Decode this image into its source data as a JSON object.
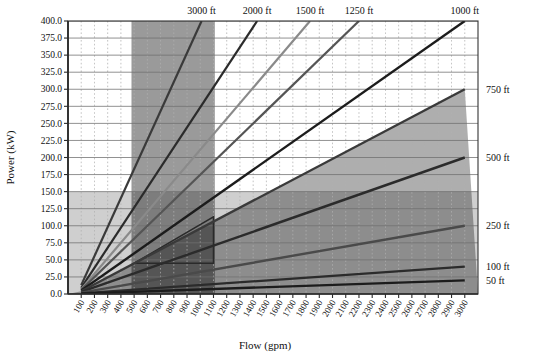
{
  "chart_data": {
    "type": "line",
    "title": "",
    "xlabel": "Flow (gpm)",
    "ylabel": "Power (kW)",
    "xlim": [
      0,
      3100
    ],
    "ylim": [
      0,
      400
    ],
    "grid": true,
    "legend_position": "inline-end-labels",
    "x_ticks": [
      100,
      200,
      300,
      400,
      500,
      600,
      700,
      800,
      900,
      1000,
      1100,
      1200,
      1300,
      1400,
      1500,
      1600,
      1700,
      1800,
      1900,
      2000,
      2100,
      2200,
      2300,
      2400,
      2500,
      2600,
      2700,
      2800,
      2900,
      3000
    ],
    "x_tick_labels": [
      "100",
      "200",
      "300",
      "400",
      "500",
      "600",
      "700",
      "800",
      "900",
      "1000",
      "1100",
      "1200",
      "1300",
      "1400",
      "1500",
      "1600",
      "1700",
      "1800",
      "1900",
      "2000",
      "2100",
      "2200",
      "2300",
      "2400",
      "2500",
      "2600",
      "2700",
      "2800",
      "2900",
      "3000"
    ],
    "y_ticks": [
      0,
      25,
      50,
      75,
      100,
      125,
      150,
      175,
      200,
      225,
      250,
      275,
      300,
      325,
      350,
      375,
      400
    ],
    "y_tick_labels": [
      "0.0",
      "25.0",
      "50.0",
      "75.0",
      "100.0",
      "125.0",
      "150.0",
      "175.0",
      "200.0",
      "225.0",
      "250.0",
      "275.0",
      "300.0",
      "325.0",
      "350.0",
      "375.0",
      "400.0"
    ],
    "series": [
      {
        "name": "3000 ft",
        "label": "3000 ft",
        "label_side": "top",
        "color": "#3a3a3a",
        "width": 2.2,
        "points": [
          [
            100,
            13
          ],
          [
            1010,
            400
          ]
        ]
      },
      {
        "name": "2000 ft",
        "label": "2000 ft",
        "label_side": "top",
        "color": "#2b2b2b",
        "width": 2.2,
        "points": [
          [
            100,
            9
          ],
          [
            1430,
            400
          ]
        ]
      },
      {
        "name": "1500 ft",
        "label": "1500 ft",
        "label_side": "top",
        "color": "#8a8a8a",
        "width": 2.2,
        "points": [
          [
            100,
            7
          ],
          [
            1830,
            400
          ]
        ]
      },
      {
        "name": "1250 ft",
        "label": "1250 ft",
        "label_side": "top",
        "color": "#555555",
        "width": 2.2,
        "points": [
          [
            100,
            6
          ],
          [
            2200,
            400
          ]
        ]
      },
      {
        "name": "1000 ft",
        "label": "1000 ft",
        "label_side": "top",
        "color": "#1c1c1c",
        "width": 2.4,
        "points": [
          [
            100,
            5
          ],
          [
            3000,
            400
          ]
        ]
      },
      {
        "name": "750 ft",
        "label": "750 ft",
        "label_side": "right",
        "color": "#3a3a3a",
        "width": 2.4,
        "points": [
          [
            100,
            4
          ],
          [
            3000,
            300
          ]
        ]
      },
      {
        "name": "500 ft",
        "label": "500 ft",
        "label_side": "right",
        "color": "#2b2b2b",
        "width": 2.4,
        "points": [
          [
            100,
            3
          ],
          [
            3000,
            200
          ]
        ]
      },
      {
        "name": "250 ft",
        "label": "250 ft",
        "label_side": "right",
        "color": "#4a4a4a",
        "width": 2.4,
        "points": [
          [
            100,
            2
          ],
          [
            3000,
            100
          ]
        ]
      },
      {
        "name": "100 ft",
        "label": "100 ft",
        "label_side": "right",
        "color": "#2b2b2b",
        "width": 2.2,
        "points": [
          [
            100,
            1
          ],
          [
            3000,
            40
          ]
        ]
      },
      {
        "name": "50 ft",
        "label": "50 ft",
        "label_side": "right",
        "color": "#1c1c1c",
        "width": 2.4,
        "points": [
          [
            100,
            0.6
          ],
          [
            3000,
            20
          ]
        ]
      }
    ],
    "shaded_regions": [
      {
        "name": "flow-band-500-1100",
        "kind": "vertical-band",
        "x0": 480,
        "x1": 1110,
        "color": "#9a9a9a",
        "opacity": 1
      },
      {
        "name": "power-band-below-150",
        "kind": "horizontal-band",
        "y0": 0,
        "y1": 150,
        "color": "#bdbdbd",
        "opacity": 1
      },
      {
        "name": "diagonal-operating-envelope",
        "kind": "below-line",
        "line": [
          [
            100,
            4
          ],
          [
            3000,
            300
          ]
        ],
        "color": "#9a9a9a",
        "opacity": 1
      },
      {
        "name": "core-operating-box",
        "kind": "outline-polygon",
        "points": [
          [
            500,
            45
          ],
          [
            1100,
            45
          ],
          [
            1100,
            113
          ],
          [
            500,
            45
          ]
        ],
        "stroke": "#2a2a2a"
      }
    ],
    "annotations": [
      {
        "text": "3000 ft",
        "x": 1010,
        "y": 400
      },
      {
        "text": "2000 ft",
        "x": 1430,
        "y": 400
      },
      {
        "text": "1500 ft",
        "x": 1830,
        "y": 400
      },
      {
        "text": "1250 ft",
        "x": 2200,
        "y": 400
      },
      {
        "text": "1000 ft",
        "x": 3000,
        "y": 400
      },
      {
        "text": "750 ft",
        "x": 3000,
        "y": 300
      },
      {
        "text": "500 ft",
        "x": 3000,
        "y": 200
      },
      {
        "text": "250 ft",
        "x": 3000,
        "y": 100
      },
      {
        "text": "100 ft",
        "x": 3000,
        "y": 40
      },
      {
        "text": "50 ft",
        "x": 3000,
        "y": 20
      }
    ],
    "colors": {
      "band_mid": "#9a9a9a",
      "band_light": "#bdbdbd",
      "band_dark": "#7c7c7c",
      "grid_major": "#6f6f6f",
      "grid_minor": "#b0b0b0",
      "axis": "#333333",
      "background": "#ffffff"
    }
  }
}
